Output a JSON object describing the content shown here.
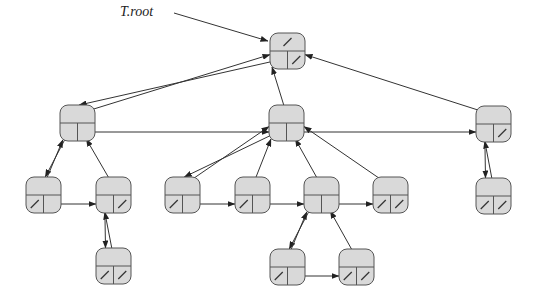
{
  "diagram": {
    "title_label": "T.root",
    "representation": "left-child, right-sibling tree",
    "colors": {
      "node_fill": "#d9d9d9",
      "node_stroke": "#555555",
      "edge": "#333333"
    },
    "nodes": [
      {
        "id": "root",
        "x": 270,
        "y": 33,
        "parent": null,
        "left_child": "A",
        "right_sibling": null
      },
      {
        "id": "A",
        "x": 60,
        "y": 105,
        "parent": "root",
        "left_child": "D",
        "right_sibling": "B"
      },
      {
        "id": "B",
        "x": 269,
        "y": 105,
        "parent": "root",
        "left_child": "F",
        "right_sibling": "C"
      },
      {
        "id": "C",
        "x": 476,
        "y": 106,
        "parent": "root",
        "left_child": "J",
        "right_sibling": null
      },
      {
        "id": "D",
        "x": 26,
        "y": 177,
        "parent": "A",
        "left_child": null,
        "right_sibling": "E"
      },
      {
        "id": "E",
        "x": 96,
        "y": 177,
        "parent": "A",
        "left_child": "K",
        "right_sibling": null
      },
      {
        "id": "F",
        "x": 165,
        "y": 177,
        "parent": "B",
        "left_child": null,
        "right_sibling": "G"
      },
      {
        "id": "G",
        "x": 235,
        "y": 177,
        "parent": "B",
        "left_child": null,
        "right_sibling": "H"
      },
      {
        "id": "H",
        "x": 304,
        "y": 177,
        "parent": "B",
        "left_child": "L",
        "right_sibling": "I"
      },
      {
        "id": "I",
        "x": 373,
        "y": 177,
        "parent": "B",
        "left_child": null,
        "right_sibling": null
      },
      {
        "id": "J",
        "x": 476,
        "y": 178,
        "parent": "C",
        "left_child": null,
        "right_sibling": null
      },
      {
        "id": "K",
        "x": 96,
        "y": 248,
        "parent": "E",
        "left_child": null,
        "right_sibling": null
      },
      {
        "id": "L",
        "x": 270,
        "y": 249,
        "parent": "H",
        "left_child": null,
        "right_sibling": "M"
      },
      {
        "id": "M",
        "x": 339,
        "y": 249,
        "parent": "H",
        "left_child": null,
        "right_sibling": null
      }
    ]
  }
}
